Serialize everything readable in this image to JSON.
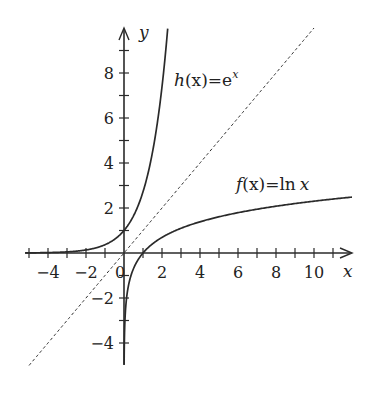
{
  "chart_data": {
    "type": "line",
    "title": "",
    "xlabel": "x",
    "ylabel": "y",
    "xlim": [
      -5.2,
      12
    ],
    "ylim": [
      -5,
      10
    ],
    "grid": false,
    "legend": "inline annotations",
    "x_ticks": [
      -4,
      -2,
      0,
      2,
      4,
      6,
      8,
      10
    ],
    "x_tick_labels": [
      "−4",
      "−2",
      "0",
      "2",
      "4",
      "6",
      "8",
      "10"
    ],
    "x_minor_ticks": [
      -5,
      -4,
      -3,
      -2,
      -1,
      1,
      2,
      3,
      4,
      5,
      6,
      7,
      8,
      9,
      10,
      11
    ],
    "y_ticks": [
      -4,
      -2,
      2,
      4,
      6,
      8
    ],
    "y_tick_labels": [
      "−4",
      "−2",
      "2",
      "4",
      "6",
      "8"
    ],
    "y_minor_ticks": [
      -4,
      -3,
      -2,
      -1,
      1,
      2,
      3,
      4,
      5,
      6,
      7,
      8,
      9
    ],
    "series": [
      {
        "name": "h(x) = e^x",
        "label": "h(x)=e^x",
        "style": "solid",
        "function": "exp",
        "x_range": [
          -5.2,
          2.3
        ],
        "points": [
          [
            -5,
            0.007
          ],
          [
            -4,
            0.018
          ],
          [
            -3,
            0.05
          ],
          [
            -2,
            0.135
          ],
          [
            -1,
            0.368
          ],
          [
            0,
            1
          ],
          [
            1,
            2.718
          ],
          [
            1.5,
            4.48
          ],
          [
            2,
            7.39
          ],
          [
            2.3,
            9.97
          ]
        ]
      },
      {
        "name": "f(x) = ln x",
        "label": "f(x)=ln x",
        "style": "solid",
        "function": "ln",
        "x_range": [
          0.007,
          12
        ],
        "points": [
          [
            0.01,
            -4.6
          ],
          [
            0.1,
            -2.3
          ],
          [
            0.5,
            -0.69
          ],
          [
            1,
            0
          ],
          [
            2,
            0.69
          ],
          [
            4,
            1.39
          ],
          [
            6,
            1.79
          ],
          [
            8,
            2.08
          ],
          [
            10,
            2.3
          ],
          [
            12,
            2.48
          ]
        ]
      },
      {
        "name": "y = x",
        "label": "",
        "style": "dashed",
        "function": "identity",
        "x_range": [
          -5.2,
          10
        ],
        "points": [
          [
            -5.2,
            -5.2
          ],
          [
            0,
            0
          ],
          [
            10,
            10
          ]
        ]
      }
    ],
    "annotations": [
      {
        "text": "h(x)=e^x",
        "x": 3.2,
        "y": 7.7
      },
      {
        "text": "f(x)=ln x",
        "x": 6,
        "y": 3
      }
    ]
  },
  "labels": {
    "x_axis": "x",
    "y_axis": "y",
    "h_fn": "h",
    "h_arg": "(x)",
    "h_eq": "=e",
    "h_exp": "x",
    "f_fn": "f",
    "f_arg": "(x)",
    "f_eq": "=ln",
    "f_var": "x"
  },
  "mapping": {
    "origin_px": [
      124,
      253
    ],
    "px_per_unit_x": 19,
    "px_per_unit_y": 22.5
  }
}
